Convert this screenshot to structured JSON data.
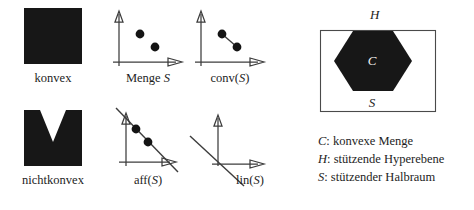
{
  "figure": {
    "width": 474,
    "height": 210,
    "background": "#ffffff",
    "ink": "#1a1a1a"
  },
  "left_panel": {
    "items": [
      {
        "id": "convex-blob",
        "kind": "filled-shape",
        "shape": "square",
        "caption": "konvex",
        "caption_italic_tail": ""
      },
      {
        "id": "menge-s",
        "kind": "axes-plot",
        "caption_prefix": "Menge ",
        "caption_italic_tail": "S",
        "caption_full": "Menge S",
        "points": 2,
        "connector": "none",
        "extra_line": "none"
      },
      {
        "id": "conv-s",
        "kind": "axes-plot",
        "caption_prefix": "conv(",
        "caption_italic_tail": "S",
        "caption_suffix": ")",
        "caption_full": "conv(S)",
        "points": 2,
        "connector": "segment",
        "extra_line": "none"
      },
      {
        "id": "nonconvex-blob",
        "kind": "filled-shape",
        "shape": "square-with-v-notch",
        "caption": "nichtkonvex",
        "caption_italic_tail": ""
      },
      {
        "id": "aff-s",
        "kind": "axes-plot",
        "caption_prefix": "aff(",
        "caption_italic_tail": "S",
        "caption_suffix": ")",
        "caption_full": "aff(S)",
        "points": 2,
        "connector": "infinite-line",
        "extra_line": "none"
      },
      {
        "id": "lin-s",
        "kind": "axes-plot",
        "caption_prefix": "lin(",
        "caption_italic_tail": "S",
        "caption_suffix": ")",
        "caption_full": "lin(S)",
        "points": 0,
        "connector": "none",
        "extra_line": "line-through-origin"
      }
    ]
  },
  "right_panel": {
    "hyperplane_label": "H",
    "convex_set_label": "C",
    "halfspace_label": "S",
    "legend": [
      {
        "symbol": "C",
        "separator": ": ",
        "text": "konvexe Menge"
      },
      {
        "symbol": "H",
        "separator": ": ",
        "text": "stützende Hyperebene"
      },
      {
        "symbol": "S",
        "separator": ": ",
        "text": "stützender Halbraum"
      }
    ]
  }
}
